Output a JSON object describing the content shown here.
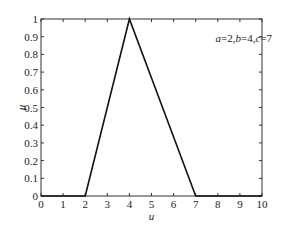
{
  "chart_data": {
    "type": "line",
    "title": "",
    "xlabel": "u",
    "ylabel": "μ",
    "xlim": [
      0,
      10
    ],
    "ylim": [
      0,
      1
    ],
    "xticks": [
      0,
      1,
      2,
      3,
      4,
      5,
      6,
      7,
      8,
      9,
      10
    ],
    "yticks": [
      0,
      0.1,
      0.2,
      0.3,
      0.4,
      0.5,
      0.6,
      0.7,
      0.8,
      0.9,
      1
    ],
    "xtick_labels": [
      "0",
      "1",
      "2",
      "3",
      "4",
      "5",
      "6",
      "7",
      "8",
      "9",
      "10"
    ],
    "ytick_labels": [
      "0",
      "0.1",
      "0.2",
      "0.3",
      "0.4",
      "0.5",
      "0.6",
      "0.7",
      "0.8",
      "0.9",
      "1"
    ],
    "grid": false,
    "series": [
      {
        "name": "triangular membership function",
        "x": [
          0,
          2,
          4,
          7,
          10
        ],
        "y": [
          0,
          0,
          1,
          0,
          0
        ],
        "color": "#111111"
      }
    ],
    "annotations": [
      {
        "parts": [
          {
            "text": "a",
            "italic": true
          },
          {
            "text": "=2,",
            "italic": false
          },
          {
            "text": "b",
            "italic": true
          },
          {
            "text": "=4,",
            "italic": false
          },
          {
            "text": "c",
            "italic": true
          },
          {
            "text": "=7",
            "italic": false
          }
        ],
        "x": 7.9,
        "y": 0.87
      }
    ]
  }
}
